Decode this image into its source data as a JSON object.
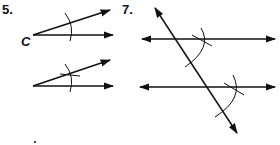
{
  "problems": [
    {
      "number": "5.",
      "vertex_label": "C"
    },
    {
      "number": "7."
    }
  ],
  "colors": {
    "ink": "#111111",
    "background": "#ffffff"
  }
}
